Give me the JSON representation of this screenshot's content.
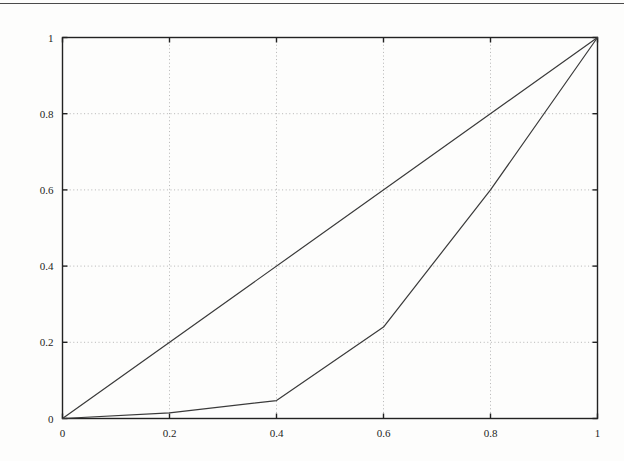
{
  "page": {
    "background_color": "#fdfdfc",
    "top_rule": {
      "name": "page-top-rule",
      "color": "#4a4a4a"
    }
  },
  "figure": {
    "frame_color": "#222222",
    "grid_color": "#b4b4b4",
    "line_color": "#3a3a3a",
    "axis_label_color": "#1d1d1d"
  },
  "chart_data": {
    "type": "line",
    "title": "",
    "subtitle": "",
    "xlabel": "",
    "ylabel": "",
    "xlim": [
      0,
      1
    ],
    "ylim": [
      0,
      1
    ],
    "grid": true,
    "grid_style": "dotted",
    "legend": null,
    "legend_position": "none",
    "annotations": [],
    "xticks": [
      0,
      0.2,
      0.4,
      0.6,
      0.8,
      1
    ],
    "yticks": [
      0,
      0.2,
      0.4,
      0.6,
      0.8,
      1
    ],
    "xtick_labels": [
      "0",
      "0.2",
      "0.4",
      "0.6",
      "0.8",
      "1"
    ],
    "ytick_labels": [
      "0",
      "0.2",
      "0.4",
      "0.6",
      "0.8",
      "1"
    ],
    "series": [
      {
        "name": "equality-line",
        "x": [
          0,
          1
        ],
        "y": [
          0,
          1
        ]
      },
      {
        "name": "lorenz-curve",
        "x": [
          0,
          0.2,
          0.4,
          0.6,
          0.8,
          1
        ],
        "y": [
          0,
          0.015,
          0.047,
          0.24,
          0.6,
          1
        ]
      }
    ]
  }
}
